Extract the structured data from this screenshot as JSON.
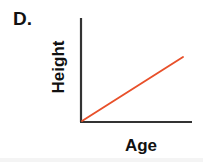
{
  "figure": {
    "panel_letter": "D.",
    "background_color": "#ffffff"
  },
  "chart_data": {
    "type": "line",
    "title": "D.",
    "xlabel": "Age",
    "ylabel": "Height",
    "grid": false,
    "legend_position": "none",
    "axis_color": "#333333",
    "line_color": "#e8502a",
    "line_width": 2,
    "xlim": [
      0,
      1
    ],
    "ylim": [
      0,
      1
    ],
    "xticks": [],
    "yticks": [],
    "xtick_labels": [],
    "ytick_labels": [],
    "series": [
      {
        "name": "Height vs Age",
        "color": "#e8502a",
        "x": [
          0,
          1
        ],
        "values": [
          0,
          0.58
        ],
        "relationship": "positive linear",
        "annotations": []
      }
    ],
    "axes_pixels": {
      "origin_x": 81,
      "origin_y": 122,
      "y_axis_top": 18,
      "x_axis_right": 192,
      "line_end_x": 183,
      "line_end_y": 57
    }
  }
}
